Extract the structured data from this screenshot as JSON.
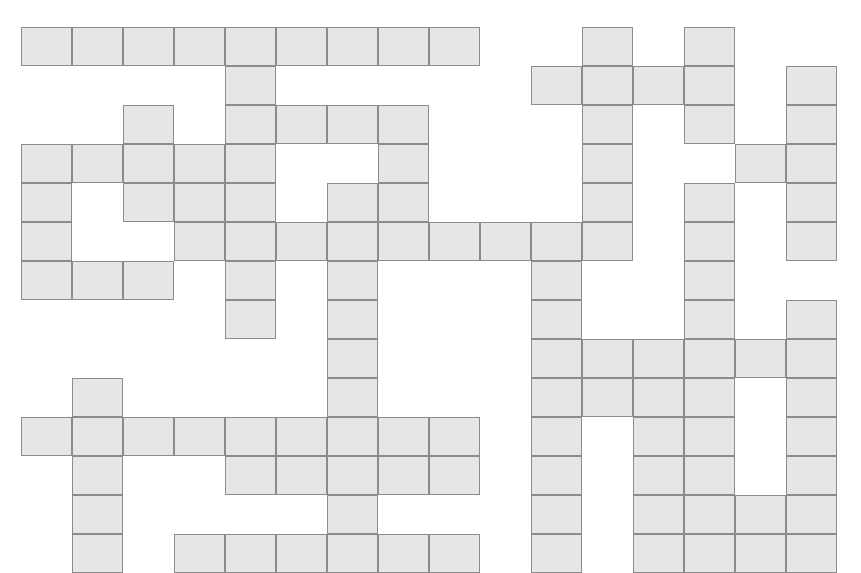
{
  "puzzle": {
    "title": "Crossword Grid",
    "type": "blank-crossword-grid",
    "columns": 16,
    "rows": 14,
    "cell_width": 51,
    "cell_height": 39,
    "origin_x": 21,
    "origin_y": 27,
    "cell_fill_color": "#e6e6e6",
    "cell_border_color": "#8c8c8c",
    "background_color": "#ffffff",
    "filled_cells": [
      [
        0,
        0
      ],
      [
        0,
        1
      ],
      [
        0,
        2
      ],
      [
        0,
        3
      ],
      [
        0,
        4
      ],
      [
        0,
        5
      ],
      [
        0,
        6
      ],
      [
        0,
        7
      ],
      [
        0,
        8
      ],
      [
        0,
        11
      ],
      [
        0,
        13
      ],
      [
        1,
        4
      ],
      [
        1,
        10
      ],
      [
        1,
        11
      ],
      [
        1,
        12
      ],
      [
        1,
        13
      ],
      [
        1,
        15
      ],
      [
        2,
        2
      ],
      [
        2,
        4
      ],
      [
        2,
        5
      ],
      [
        2,
        6
      ],
      [
        2,
        7
      ],
      [
        2,
        11
      ],
      [
        2,
        13
      ],
      [
        2,
        15
      ],
      [
        3,
        0
      ],
      [
        3,
        1
      ],
      [
        3,
        2
      ],
      [
        3,
        3
      ],
      [
        3,
        4
      ],
      [
        3,
        7
      ],
      [
        3,
        11
      ],
      [
        3,
        14
      ],
      [
        3,
        15
      ],
      [
        4,
        0
      ],
      [
        4,
        2
      ],
      [
        4,
        3
      ],
      [
        4,
        4
      ],
      [
        4,
        6
      ],
      [
        4,
        7
      ],
      [
        4,
        11
      ],
      [
        4,
        13
      ],
      [
        4,
        15
      ],
      [
        5,
        0
      ],
      [
        5,
        3
      ],
      [
        5,
        4
      ],
      [
        5,
        5
      ],
      [
        5,
        6
      ],
      [
        5,
        7
      ],
      [
        5,
        8
      ],
      [
        5,
        9
      ],
      [
        5,
        10
      ],
      [
        5,
        11
      ],
      [
        5,
        13
      ],
      [
        5,
        15
      ],
      [
        6,
        0
      ],
      [
        6,
        1
      ],
      [
        6,
        2
      ],
      [
        6,
        4
      ],
      [
        6,
        6
      ],
      [
        6,
        10
      ],
      [
        6,
        13
      ],
      [
        7,
        4
      ],
      [
        7,
        6
      ],
      [
        7,
        10
      ],
      [
        7,
        13
      ],
      [
        7,
        15
      ],
      [
        8,
        6
      ],
      [
        8,
        10
      ],
      [
        8,
        11
      ],
      [
        8,
        12
      ],
      [
        8,
        13
      ],
      [
        8,
        14
      ],
      [
        8,
        15
      ],
      [
        9,
        1
      ],
      [
        9,
        6
      ],
      [
        9,
        10
      ],
      [
        9,
        11
      ],
      [
        9,
        12
      ],
      [
        9,
        13
      ],
      [
        9,
        15
      ],
      [
        10,
        0
      ],
      [
        10,
        1
      ],
      [
        10,
        2
      ],
      [
        10,
        3
      ],
      [
        10,
        4
      ],
      [
        10,
        5
      ],
      [
        10,
        6
      ],
      [
        10,
        7
      ],
      [
        10,
        8
      ],
      [
        10,
        10
      ],
      [
        10,
        12
      ],
      [
        10,
        13
      ],
      [
        10,
        15
      ],
      [
        11,
        1
      ],
      [
        11,
        4
      ],
      [
        11,
        5
      ],
      [
        11,
        6
      ],
      [
        11,
        7
      ],
      [
        11,
        8
      ],
      [
        11,
        10
      ],
      [
        11,
        12
      ],
      [
        11,
        13
      ],
      [
        11,
        15
      ],
      [
        12,
        1
      ],
      [
        12,
        6
      ],
      [
        12,
        10
      ],
      [
        12,
        12
      ],
      [
        12,
        13
      ],
      [
        12,
        14
      ],
      [
        12,
        15
      ],
      [
        13,
        1
      ],
      [
        13,
        3
      ],
      [
        13,
        4
      ],
      [
        13,
        5
      ],
      [
        13,
        6
      ],
      [
        13,
        7
      ],
      [
        13,
        8
      ],
      [
        13,
        10
      ],
      [
        13,
        12
      ],
      [
        13,
        13
      ],
      [
        13,
        14
      ],
      [
        13,
        15
      ]
    ],
    "letters": [],
    "clue_numbers": []
  }
}
